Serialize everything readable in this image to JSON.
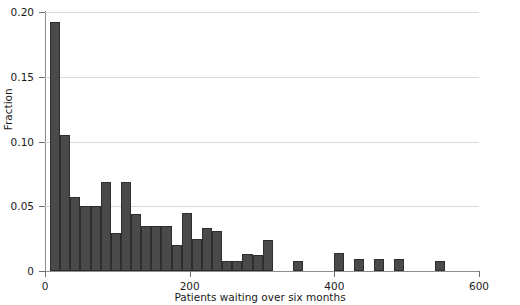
{
  "chart_data": {
    "type": "bar",
    "title": "",
    "subtitle": "",
    "xlabel": "Patients waiting over six months",
    "ylabel": "Fraction",
    "xlim": [
      0,
      600
    ],
    "ylim": [
      0,
      0.2
    ],
    "xticks": [
      0,
      200,
      400,
      600
    ],
    "xtick_labels": [
      "0",
      "200",
      "400",
      "600"
    ],
    "yticks": [
      0,
      0.05,
      0.1,
      0.15,
      0.2
    ],
    "ytick_labels": [
      "0",
      "0.05",
      "0.10",
      "0.15",
      "0.20"
    ],
    "grid": "horizontal",
    "legend": "none",
    "bar_color": "#4a4a4a",
    "bar_edge_color": "#2e2e2e",
    "bin_width": 14,
    "bin_starts": [
      7,
      21,
      35,
      49,
      63,
      77,
      91,
      105,
      119,
      133,
      147,
      161,
      175,
      189,
      203,
      217,
      231,
      245,
      259,
      273,
      287,
      301,
      343,
      399,
      427,
      455,
      483,
      539
    ],
    "values": [
      0.192,
      0.105,
      0.057,
      0.05,
      0.05,
      0.069,
      0.029,
      0.069,
      0.044,
      0.035,
      0.035,
      0.035,
      0.02,
      0.045,
      0.025,
      0.033,
      0.031,
      0.008,
      0.008,
      0.013,
      0.012,
      0.024,
      0.008,
      0.014,
      0.009,
      0.009,
      0.009,
      0.008
    ],
    "bars": [
      {
        "x0": 7,
        "x1": 21,
        "value": 0.192
      },
      {
        "x0": 21,
        "x1": 35,
        "value": 0.105
      },
      {
        "x0": 35,
        "x1": 49,
        "value": 0.057
      },
      {
        "x0": 49,
        "x1": 63,
        "value": 0.05
      },
      {
        "x0": 63,
        "x1": 77,
        "value": 0.05
      },
      {
        "x0": 77,
        "x1": 91,
        "value": 0.069
      },
      {
        "x0": 91,
        "x1": 105,
        "value": 0.029
      },
      {
        "x0": 105,
        "x1": 119,
        "value": 0.069
      },
      {
        "x0": 119,
        "x1": 133,
        "value": 0.044
      },
      {
        "x0": 133,
        "x1": 147,
        "value": 0.035
      },
      {
        "x0": 147,
        "x1": 161,
        "value": 0.035
      },
      {
        "x0": 161,
        "x1": 175,
        "value": 0.035
      },
      {
        "x0": 175,
        "x1": 189,
        "value": 0.02
      },
      {
        "x0": 189,
        "x1": 203,
        "value": 0.045
      },
      {
        "x0": 203,
        "x1": 217,
        "value": 0.025
      },
      {
        "x0": 217,
        "x1": 231,
        "value": 0.033
      },
      {
        "x0": 231,
        "x1": 245,
        "value": 0.031
      },
      {
        "x0": 245,
        "x1": 259,
        "value": 0.008
      },
      {
        "x0": 259,
        "x1": 273,
        "value": 0.008
      },
      {
        "x0": 273,
        "x1": 287,
        "value": 0.013
      },
      {
        "x0": 287,
        "x1": 301,
        "value": 0.012
      },
      {
        "x0": 301,
        "x1": 315,
        "value": 0.024
      },
      {
        "x0": 343,
        "x1": 357,
        "value": 0.008
      },
      {
        "x0": 399,
        "x1": 413,
        "value": 0.014
      },
      {
        "x0": 427,
        "x1": 441,
        "value": 0.009
      },
      {
        "x0": 455,
        "x1": 469,
        "value": 0.009
      },
      {
        "x0": 483,
        "x1": 497,
        "value": 0.009
      },
      {
        "x0": 539,
        "x1": 553,
        "value": 0.008
      }
    ]
  }
}
